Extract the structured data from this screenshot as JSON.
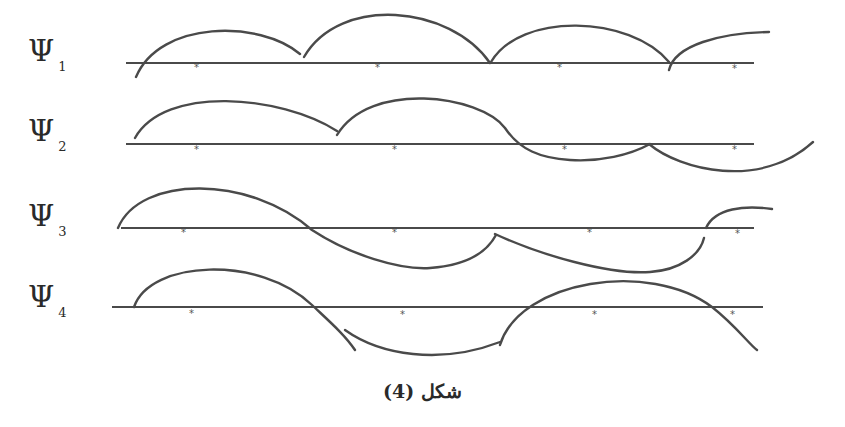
{
  "figure": {
    "caption": "شكل (4)",
    "line_color": "#4a4a4a",
    "background": "#ffffff",
    "rows": [
      {
        "symbol": "Ψ",
        "subscript": "1",
        "label_x": 28,
        "label_y": 38,
        "axis_y": 63,
        "axis_x1": 126,
        "axis_x2": 754,
        "markers_x": [
          197,
          378,
          560,
          735
        ]
      },
      {
        "symbol": "Ψ",
        "subscript": "2",
        "label_x": 28,
        "label_y": 118,
        "axis_y": 144,
        "axis_x1": 126,
        "axis_x2": 754,
        "markers_x": [
          197,
          395,
          565,
          735
        ]
      },
      {
        "symbol": "Ψ",
        "subscript": "3",
        "label_x": 28,
        "label_y": 205,
        "axis_y": 228,
        "axis_x1": 121,
        "axis_x2": 754,
        "markers_x": [
          184,
          395,
          590,
          738
        ]
      },
      {
        "symbol": "Ψ",
        "subscript": "4",
        "label_x": 28,
        "label_y": 285,
        "axis_y": 307,
        "axis_x1": 112,
        "axis_x2": 763,
        "markers_x": [
          192,
          403,
          595,
          733
        ]
      }
    ],
    "marker_glyph": "*"
  }
}
